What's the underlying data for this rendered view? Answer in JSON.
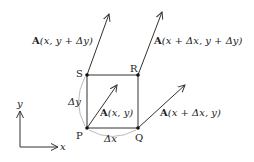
{
  "points": {
    "P": {
      "label": "P"
    },
    "Q": {
      "label": "Q"
    },
    "R": {
      "label": "R"
    },
    "S": {
      "label": "S"
    }
  },
  "vectors": {
    "at_P": {
      "bold": "A",
      "args": "(x, y)"
    },
    "at_Q": {
      "bold": "A",
      "args": "(x + Δx, y)"
    },
    "at_R": {
      "bold": "A",
      "args": "(x + Δx, y + Δy)"
    },
    "at_S": {
      "bold": "A",
      "args": "(x, y + Δy)"
    }
  },
  "sides": {
    "dx": "Δx",
    "dy": "Δy"
  },
  "axes": {
    "x": "x",
    "y": "y"
  },
  "colors": {
    "line": "#333333",
    "arc": "#aaaaaa"
  }
}
